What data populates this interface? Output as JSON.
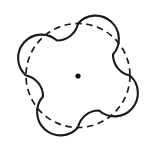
{
  "figure": {
    "title": "Four-petal rounded figure inscribed on a dashed circle",
    "background_color": "#ffffff",
    "stroke_color": "#1a1a1a",
    "dot_color": "#111111",
    "canvas": {
      "width": 158,
      "height": 152
    },
    "center": {
      "x": 78,
      "y": 75.5
    },
    "center_dot": {
      "cx": 78,
      "cy": 76,
      "r": 2.6,
      "label": "center-point"
    },
    "dashed_circle": {
      "cx": 78,
      "cy": 75.5,
      "r": 52,
      "stroke_width": 1.7,
      "dash_pattern": "6.5 4.5",
      "label": "reference-circle"
    },
    "solid_outline": {
      "stroke_width": 2.1,
      "lobe_radius": 21.2,
      "lobe_count": 4,
      "lobe_centers_deg": [
        270,
        0,
        90,
        180
      ],
      "notch_centers_deg": [
        315,
        45,
        135,
        225
      ],
      "extents": {
        "left": 12,
        "right": 145,
        "top": 11,
        "bottom": 140
      },
      "path": "M 78 23.5 A 21.2 21.2 0 0 1 113 54.5 A 21.2 21.2 0 0 0 130 75.5 A 21.2 21.2 0 0 1 99 110.5 A 21.2 21.2 0 0 0 78 127.5 A 21.2 21.2 0 0 1 43 96.5 A 21.2 21.2 0 0 0 26 75.5 A 21.2 21.2 0 0 1 57 40.5 A 21.2 21.2 0 0 0 78 23.5 Z",
      "label": "petal-outline"
    }
  }
}
